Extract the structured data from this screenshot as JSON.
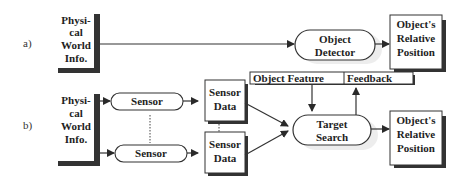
{
  "diagram": {
    "row_a": {
      "label": "a)",
      "input_box": {
        "lines": [
          "Physi-",
          "cal",
          "World",
          "Info."
        ]
      },
      "process": {
        "lines": [
          "Object",
          "Detector"
        ]
      },
      "output_box": {
        "lines": [
          "Object's",
          "Relative",
          "Position"
        ]
      }
    },
    "row_b": {
      "label": "b)",
      "input_box": {
        "lines": [
          "Physi-",
          "cal",
          "World",
          "Info."
        ]
      },
      "sensors": [
        {
          "label": "Sensor"
        },
        {
          "label": "Sensor"
        }
      ],
      "sensor_data": [
        {
          "lines": [
            "Sensor",
            "Data"
          ]
        },
        {
          "lines": [
            "Sensor",
            "Data"
          ]
        }
      ],
      "feedback_bar": {
        "left_label": "Object Feature",
        "right_label": "Feedback"
      },
      "process": {
        "lines": [
          "Target",
          "Search"
        ]
      },
      "output_box": {
        "lines": [
          "Object's",
          "Relative",
          "Position"
        ]
      }
    }
  }
}
